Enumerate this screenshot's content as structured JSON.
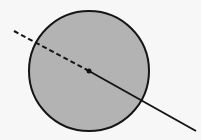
{
  "diagram": {
    "background": "#f7f7f7",
    "circle": {
      "cx": 89,
      "cy": 71,
      "r": 60,
      "fill": "#b3b3b3",
      "stroke": "#151515",
      "stroke_width": 2
    },
    "center_point": {
      "cx": 89,
      "cy": 71,
      "r": 2.5,
      "fill": "#111111"
    },
    "dashed_segment": {
      "x1": 14,
      "y1": 31,
      "x2": 89,
      "y2": 71,
      "stroke": "#151515",
      "dash": "5,3"
    },
    "solid_segment": {
      "x1": 89,
      "y1": 71,
      "x2": 196,
      "y2": 131,
      "stroke": "#151515"
    }
  }
}
